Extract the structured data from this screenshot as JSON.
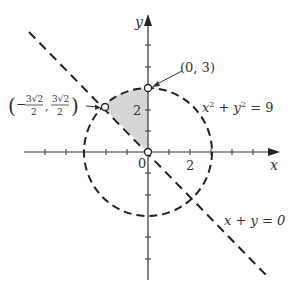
{
  "diagram": {
    "type": "coordinate-plane",
    "colors": {
      "axis": "#333333",
      "curve": "#222222",
      "shade": "#d6d6d6",
      "text": "#333333",
      "background": "#ffffff"
    },
    "axes": {
      "x_label": "x",
      "y_label": "y",
      "origin_label": "0",
      "x_tick_label": "2",
      "y_tick_label": "2",
      "x_range": [
        -7,
        5
      ],
      "y_range": [
        -6,
        7
      ],
      "tick_spacing": 1
    },
    "circle": {
      "equation_label": "x² + y² = 9",
      "eq_x": "x",
      "eq_sup1": "2",
      "eq_mid": " + y",
      "eq_sup2": "2",
      "eq_end": " = 9",
      "center": [
        0,
        0
      ],
      "radius": 3,
      "style": "dashed"
    },
    "line": {
      "equation_label": "x + y = 0",
      "style": "dashed"
    },
    "points": [
      {
        "label": "(0, 3)",
        "x": 0,
        "y": 3,
        "style": "open"
      },
      {
        "label": "(−3√2/2, 3√2/2)",
        "label_num": "3√2",
        "label_den": "2",
        "x": -2.121,
        "y": 2.121,
        "style": "open"
      },
      {
        "label": "",
        "x": 0,
        "y": 0,
        "style": "open"
      }
    ],
    "shaded_region": "sector between y-axis and line x+y=0 inside circle, second quadrant"
  }
}
